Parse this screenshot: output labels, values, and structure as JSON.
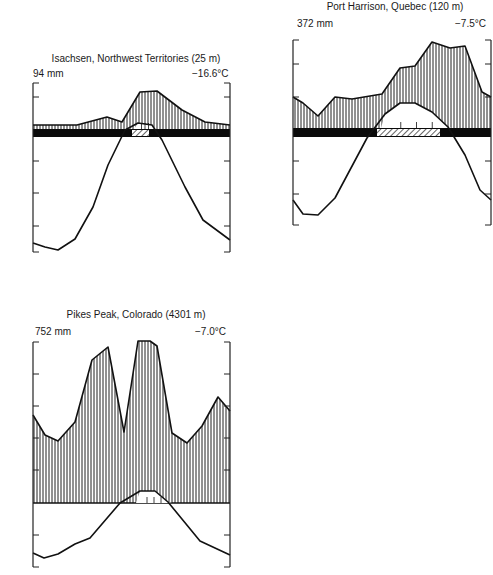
{
  "chart_data": [
    {
      "type": "line",
      "title": "Isachsen, Northwest Territories (25 m)",
      "precip_label": "94 mm",
      "temp_label": "−16.6°C",
      "months": [
        "J",
        "F",
        "M",
        "A",
        "M",
        "J",
        "J",
        "A",
        "S",
        "O",
        "N",
        "D"
      ],
      "description": "Walter climate diagram: vertically hatched precipitation area above black frost band, temperature curve below",
      "frame": {
        "x0": 33,
        "x1": 230,
        "y_top": 83,
        "y_bottom": 252
      },
      "ticks_y": [
        97,
        161,
        193,
        226
      ],
      "band": {
        "y0": 129,
        "y1": 137,
        "hatch_x0": 132,
        "hatch_x1": 149
      },
      "precip_points": [
        [
          33,
          125
        ],
        [
          77,
          125
        ],
        [
          107,
          117
        ],
        [
          122,
          122
        ],
        [
          140,
          92
        ],
        [
          157,
          91
        ],
        [
          182,
          110
        ],
        [
          205,
          122
        ],
        [
          230,
          125
        ]
      ],
      "temp_points": [
        [
          33,
          243
        ],
        [
          45,
          247
        ],
        [
          58,
          250
        ],
        [
          75,
          239
        ],
        [
          93,
          207
        ],
        [
          108,
          165
        ],
        [
          125,
          130
        ],
        [
          138,
          123
        ],
        [
          152,
          125
        ],
        [
          162,
          140
        ],
        [
          185,
          187
        ],
        [
          203,
          220
        ],
        [
          230,
          240
        ]
      ]
    },
    {
      "type": "line",
      "title": "Port Harrison, Quebec (120 m)",
      "precip_label": "372 mm",
      "temp_label": "−7.5°C",
      "months": [
        "J",
        "F",
        "M",
        "A",
        "M",
        "J",
        "J",
        "A",
        "S",
        "O",
        "N",
        "D"
      ],
      "description": "Walter climate diagram: vertically hatched precipitation area above black frost band, temperature curve below",
      "frame": {
        "x0": 293,
        "x1": 491,
        "y_top": 40,
        "y_bottom": 225
      },
      "ticks_y": [
        64,
        97,
        161,
        194
      ],
      "band": {
        "y0": 128,
        "y1": 137,
        "hatch_x0": 377,
        "hatch_x1": 440
      },
      "precip_points": [
        [
          293,
          97
        ],
        [
          303,
          103
        ],
        [
          318,
          116
        ],
        [
          335,
          97
        ],
        [
          352,
          99
        ],
        [
          382,
          94
        ],
        [
          400,
          68
        ],
        [
          415,
          66
        ],
        [
          432,
          42
        ],
        [
          450,
          48
        ],
        [
          465,
          46
        ],
        [
          482,
          92
        ],
        [
          491,
          97
        ]
      ],
      "temp_points": [
        [
          293,
          200
        ],
        [
          303,
          214
        ],
        [
          318,
          215
        ],
        [
          335,
          198
        ],
        [
          367,
          138
        ],
        [
          385,
          114
        ],
        [
          400,
          103
        ],
        [
          415,
          103
        ],
        [
          432,
          112
        ],
        [
          448,
          127
        ],
        [
          465,
          155
        ],
        [
          480,
          190
        ],
        [
          491,
          200
        ]
      ]
    },
    {
      "type": "line",
      "title": "Pikes Peak, Colorado (4301 m)",
      "precip_label": "752 mm",
      "temp_label": "−7.0°C",
      "months": [
        "J",
        "F",
        "M",
        "A",
        "M",
        "J",
        "J",
        "A",
        "S",
        "O",
        "N",
        "D"
      ],
      "description": "Walter climate diagram: vertically hatched precipitation area above zero line, temperature curve below",
      "frame": {
        "x0": 33,
        "x1": 230,
        "y_top": 342,
        "y_bottom": 567
      },
      "ticks_y": [
        374,
        406,
        438,
        470,
        535
      ],
      "zero_y": 503,
      "precip_points": [
        [
          33,
          415
        ],
        [
          45,
          435
        ],
        [
          58,
          441
        ],
        [
          75,
          422
        ],
        [
          92,
          360
        ],
        [
          108,
          347
        ],
        [
          124,
          432
        ],
        [
          138,
          341
        ],
        [
          150,
          341
        ],
        [
          157,
          346
        ],
        [
          172,
          433
        ],
        [
          187,
          443
        ],
        [
          202,
          426
        ],
        [
          218,
          397
        ],
        [
          230,
          411
        ]
      ],
      "temp_points": [
        [
          33,
          553
        ],
        [
          44,
          558
        ],
        [
          58,
          554
        ],
        [
          75,
          544
        ],
        [
          90,
          538
        ],
        [
          120,
          503
        ],
        [
          140,
          491
        ],
        [
          155,
          491
        ],
        [
          168,
          502
        ],
        [
          200,
          541
        ],
        [
          230,
          555
        ]
      ]
    }
  ]
}
